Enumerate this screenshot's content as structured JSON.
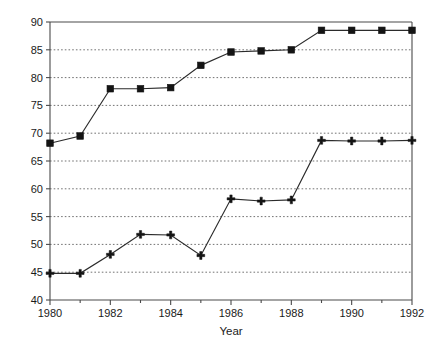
{
  "chart_data": {
    "type": "line",
    "title": "",
    "subtitle": "",
    "xlabel": "Year",
    "ylabel": "",
    "xlim": [
      1980,
      1992
    ],
    "ylim": [
      40,
      90
    ],
    "grid": true,
    "legend": "none",
    "x": [
      1980,
      1981,
      1982,
      1983,
      1984,
      1985,
      1986,
      1987,
      1988,
      1989,
      1990,
      1991,
      1992
    ],
    "xticks": [
      1980,
      1982,
      1984,
      1986,
      1988,
      1990,
      1992
    ],
    "xtick_labels": [
      "1980",
      "1982",
      "1984",
      "1986",
      "1988",
      "1990",
      "1992"
    ],
    "xminor_ticks": [
      1981,
      1983,
      1985,
      1987,
      1989,
      1991
    ],
    "yticks": [
      40,
      45,
      50,
      55,
      60,
      65,
      70,
      75,
      80,
      85,
      90
    ],
    "ytick_labels": [
      "40",
      "45",
      "50",
      "55",
      "60",
      "65",
      "70",
      "75",
      "80",
      "85",
      "90"
    ],
    "series": [
      {
        "name": "upper-series",
        "marker": "square",
        "color": "#141414",
        "values": [
          68.2,
          69.5,
          78.0,
          78.0,
          78.2,
          82.2,
          84.6,
          84.8,
          85.0,
          88.5,
          88.5,
          88.5,
          88.5
        ]
      },
      {
        "name": "lower-series",
        "marker": "plus",
        "color": "#141414",
        "values": [
          44.8,
          44.8,
          48.2,
          51.8,
          51.7,
          48.0,
          58.2,
          57.8,
          58.0,
          68.7,
          68.6,
          68.6,
          68.7
        ]
      }
    ]
  },
  "axis": {
    "x_title": "Year"
  }
}
